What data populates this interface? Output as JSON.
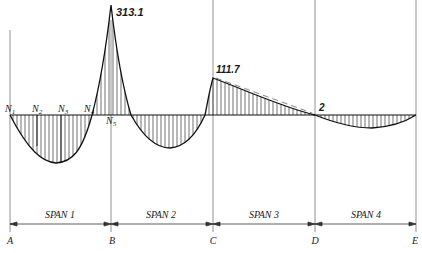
{
  "diagram": {
    "type": "continuous beam bending moment diagram",
    "peak_labels": {
      "support_B": "313.1",
      "support_C": "111.7",
      "point_D": "2"
    },
    "node_labels": [
      "N1",
      "N2",
      "N3",
      "N4",
      "N5"
    ],
    "node_label_parts": [
      {
        "main": "N",
        "sub": "1"
      },
      {
        "main": "N",
        "sub": "2"
      },
      {
        "main": "N",
        "sub": "3"
      },
      {
        "main": "N",
        "sub": "4"
      },
      {
        "main": "N",
        "sub": "5"
      }
    ],
    "spans": [
      "SPAN 1",
      "SPAN 2",
      "SPAN 3",
      "SPAN 4"
    ],
    "supports": [
      "A",
      "B",
      "C",
      "D",
      "E"
    ]
  }
}
